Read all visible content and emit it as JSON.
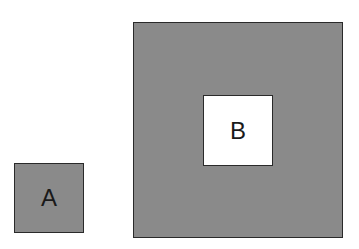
{
  "diagram": {
    "square_a": {
      "label": "A",
      "fill": "#8a8a8a"
    },
    "square_large": {
      "fill": "#8a8a8a"
    },
    "square_b": {
      "label": "B",
      "fill": "#ffffff"
    }
  }
}
